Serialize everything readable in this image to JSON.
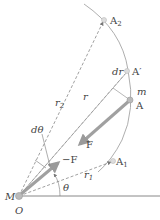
{
  "diagram": {
    "labels": {
      "A2": "A",
      "A2_sub": "2",
      "A_prime": "A′",
      "A": "A",
      "A1": "A",
      "A1_sub": "1",
      "m": "m",
      "M": "M",
      "O": "O",
      "r": "r",
      "r1": "r",
      "r1_sub": "1",
      "r2": "r",
      "r2_sub": "2",
      "dr": "dr",
      "dtheta": "dθ",
      "theta": "θ",
      "F": "F",
      "negF": "−F"
    },
    "colors": {
      "line": "#888888",
      "force_arrow": "#9a9a9a",
      "text": "#444444",
      "point": "#bbbbbb"
    }
  }
}
